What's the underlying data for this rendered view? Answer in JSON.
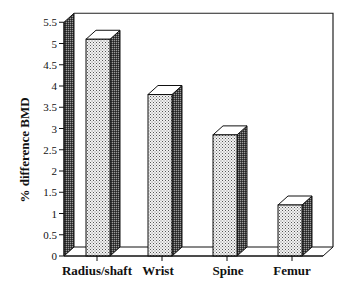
{
  "chart_data": {
    "type": "bar",
    "title": "",
    "xlabel": "",
    "ylabel": "% difference BMD",
    "categories": [
      "Radius/shaft",
      "Wrist",
      "Spine",
      "Femur"
    ],
    "values": [
      5.1,
      3.8,
      2.85,
      1.2
    ],
    "ylim": [
      0,
      5.5
    ],
    "yticks": [
      "0",
      "0.5",
      "1",
      "1.5",
      "2",
      "2.5",
      "3",
      "3.5",
      "4",
      "4.5",
      "5",
      "5.5"
    ],
    "grid": false,
    "legend": null,
    "style": "3d-bars-stippled"
  }
}
